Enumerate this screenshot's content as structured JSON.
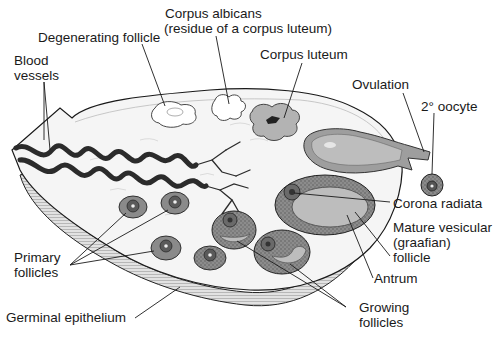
{
  "diagram": {
    "style": "grayscale anatomical line illustration",
    "colors": {
      "background": "#ffffff",
      "ink": "#1a1a1a",
      "stroma": "#f4f4f4",
      "capsule": "#d9d9d9",
      "follicle_granulosa": "#8a8a8a",
      "antrum": "#bdbdbd",
      "corpus_luteum": "#b3b3b3",
      "vessel": "#2b2b2b"
    },
    "labels": {
      "corpus_albicans_line1": "Corpus albicans",
      "corpus_albicans_line2": "(residue of a corpus luteum)",
      "degenerating_follicle": "Degenerating follicle",
      "blood_vessels_line1": "Blood",
      "blood_vessels_line2": "vessels",
      "corpus_luteum": "Corpus luteum",
      "ovulation": "Ovulation",
      "secondary_oocyte": "2° oocyte",
      "corona_radiata": "Corona radiata",
      "mature_follicle_line1": "Mature vesicular",
      "mature_follicle_line2": "(graafian)",
      "mature_follicle_line3": "follicle",
      "antrum": "Antrum",
      "primary_follicles_line1": "Primary",
      "primary_follicles_line2": "follicles",
      "germinal_epithelium": "Germinal epithelium",
      "growing_follicles_line1": "Growing",
      "growing_follicles_line2": "follicles"
    },
    "structures": [
      "blood-vessels",
      "degenerating-follicle",
      "corpus-albicans",
      "corpus-luteum",
      "ruptured-follicle-ovulation",
      "secondary-oocyte",
      "mature-graafian-follicle",
      "corona-radiata",
      "antrum",
      "primary-follicles",
      "growing-follicles",
      "germinal-epithelium"
    ]
  }
}
